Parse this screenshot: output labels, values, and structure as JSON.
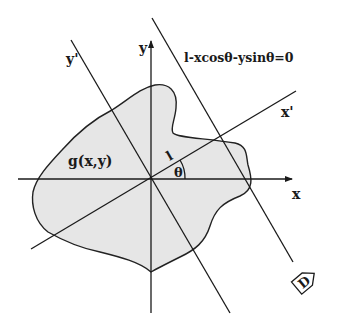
{
  "figure": {
    "labels": {
      "x_axis": "x",
      "y_axis": "y",
      "x_prime_axis": "x'",
      "y_prime_axis": "y'",
      "line_equation": "l-xcosθ-ysinθ=0",
      "function": "g(x,y)",
      "distance": "l",
      "angle": "θ",
      "marker": "D"
    },
    "colors": {
      "background": "#ffffff",
      "region_fill": "#e6e6e6",
      "stroke": "#1a1a1a"
    }
  }
}
